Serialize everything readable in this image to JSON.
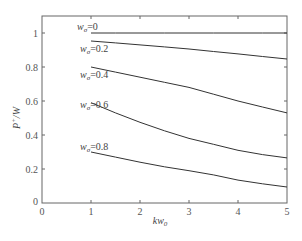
{
  "chart_data": {
    "type": "line",
    "title": "",
    "xlabel": "kw0",
    "xlabel_main": "kw",
    "xlabel_sub": "0",
    "ylabel": "P+/W",
    "ylabel_main": "P",
    "ylabel_sup": "+",
    "ylabel_rest": "/W",
    "xlim": [
      0,
      5
    ],
    "ylim": [
      0,
      1.1
    ],
    "grid": false,
    "legend_position": "inline-labels",
    "x_ticks": [
      0,
      1,
      2,
      3,
      4,
      5
    ],
    "x_tick_labels": [
      "0",
      "1",
      "2",
      "3",
      "4",
      "5"
    ],
    "y_ticks": [
      0,
      0.2,
      0.4,
      0.6,
      0.8,
      1
    ],
    "y_tick_labels": [
      "0",
      "0.2",
      "0.4",
      "0.6",
      "0.8",
      "1"
    ],
    "x": [
      1,
      1.5,
      2,
      2.5,
      3,
      3.5,
      4,
      4.5,
      5
    ],
    "series": [
      {
        "name": "w_σ=0",
        "label_main": "w",
        "label_sub": "σ",
        "label_rest": "=0",
        "values": [
          1.0,
          1.0,
          1.0,
          1.0,
          1.0,
          1.0,
          1.0,
          1.0,
          1.0
        ]
      },
      {
        "name": "w_σ=0.2",
        "label_main": "w",
        "label_sub": "σ",
        "label_rest": "=0.2",
        "values": [
          0.953,
          0.942,
          0.93,
          0.918,
          0.906,
          0.891,
          0.877,
          0.862,
          0.847
        ]
      },
      {
        "name": "w_σ=0.4",
        "label_main": "w",
        "label_sub": "σ",
        "label_rest": "=0.4",
        "values": [
          0.8,
          0.77,
          0.74,
          0.71,
          0.68,
          0.64,
          0.6,
          0.565,
          0.53
        ]
      },
      {
        "name": "w_σ=0.6",
        "label_main": "w",
        "label_sub": "σ",
        "label_rest": "=0.6",
        "values": [
          0.59,
          0.53,
          0.475,
          0.425,
          0.38,
          0.345,
          0.31,
          0.285,
          0.265
        ]
      },
      {
        "name": "w_σ=0.8",
        "label_main": "w",
        "label_sub": "σ",
        "label_rest": "=0.8",
        "values": [
          0.3,
          0.27,
          0.24,
          0.213,
          0.19,
          0.165,
          0.135,
          0.113,
          0.094
        ]
      }
    ],
    "colors": {
      "line": "#333333",
      "axis": "#555555",
      "text": "#444444"
    }
  }
}
